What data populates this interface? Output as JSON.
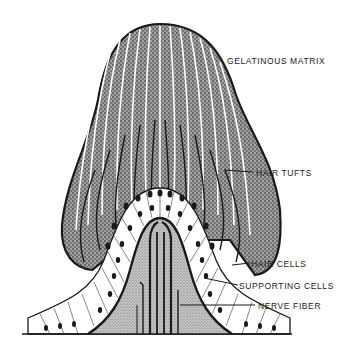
{
  "diagram": {
    "labels": {
      "gelatinous_matrix": "GELATINOUS MATRIX",
      "hair_tufts": "HAIR TUFTS",
      "hair_cells": "HAIR CELLS",
      "supporting_cells": "SUPPORTING CELLS",
      "nerve_fiber": "NERVE FIBER"
    },
    "colors": {
      "ink": "#1a1a1a",
      "stipple": "#6b6b6b",
      "background": "#ffffff"
    }
  }
}
